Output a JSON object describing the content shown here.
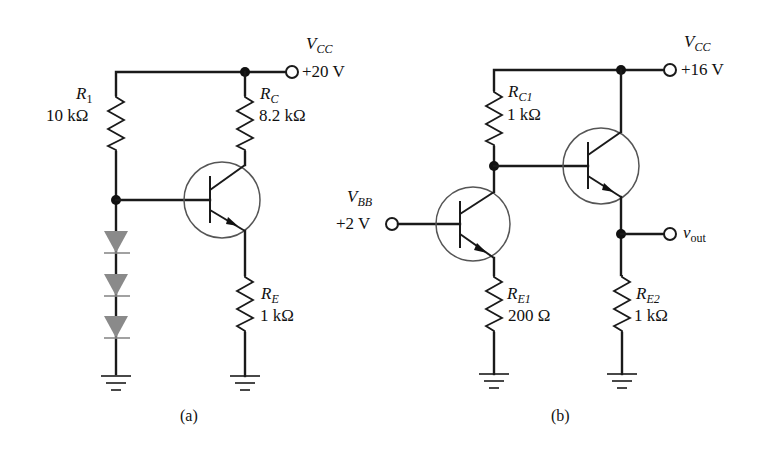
{
  "circuits": [
    {
      "id": "a",
      "caption": "(a)",
      "supply": {
        "symbol": "V",
        "subscript": "CC",
        "value": "+20 V"
      },
      "resistors": [
        {
          "id": "R1",
          "symbol": "R",
          "subscript": "1",
          "value": "10 kΩ"
        },
        {
          "id": "RC",
          "symbol": "R",
          "subscript": "C",
          "value": "8.2 kΩ"
        },
        {
          "id": "RE",
          "symbol": "R",
          "subscript": "E",
          "value": "1 kΩ"
        }
      ],
      "diodes": 3,
      "transistors": 1
    },
    {
      "id": "b",
      "caption": "(b)",
      "supply": {
        "symbol": "V",
        "subscript": "CC",
        "value": "+16 V"
      },
      "input": {
        "symbol": "V",
        "subscript": "BB",
        "value": "+2 V"
      },
      "output": {
        "symbol": "v",
        "subscript": "out"
      },
      "resistors": [
        {
          "id": "RC1",
          "symbol": "R",
          "subscript": "C1",
          "value": "1 kΩ"
        },
        {
          "id": "RE1",
          "symbol": "R",
          "subscript": "E1",
          "value": "200 Ω"
        },
        {
          "id": "RE2",
          "symbol": "R",
          "subscript": "E2",
          "value": "1 kΩ"
        }
      ],
      "transistors": 2
    }
  ],
  "colors": {
    "wire": "#1a1a1a",
    "diode": "#8a8a8a",
    "transistor_circle": "#555555"
  }
}
